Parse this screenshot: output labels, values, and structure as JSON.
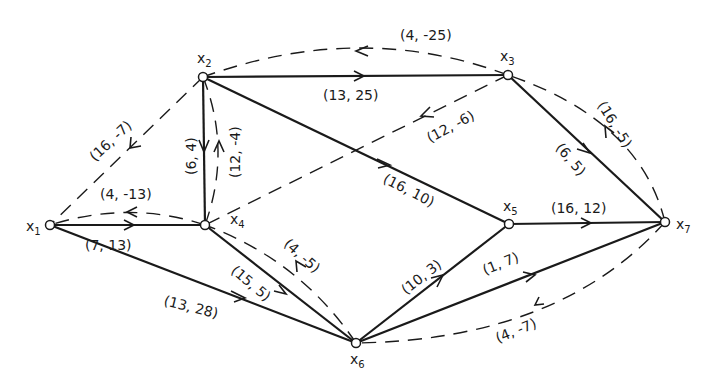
{
  "diagram": {
    "type": "directed network graph (flow network with residual arcs)",
    "nodes": [
      {
        "id": "x1",
        "label": "x",
        "sub": "1",
        "x": 50,
        "y": 225,
        "lx": 26,
        "ly": 231
      },
      {
        "id": "x2",
        "label": "x",
        "sub": "2",
        "x": 203,
        "y": 77,
        "lx": 197,
        "ly": 63
      },
      {
        "id": "x3",
        "label": "x",
        "sub": "3",
        "x": 508,
        "y": 75,
        "lx": 500,
        "ly": 61
      },
      {
        "id": "x4",
        "label": "x",
        "sub": "4",
        "x": 205,
        "y": 225,
        "lx": 230,
        "ly": 224
      },
      {
        "id": "x5",
        "label": "x",
        "sub": "5",
        "x": 509,
        "y": 224,
        "lx": 503,
        "ly": 211
      },
      {
        "id": "x6",
        "label": "x",
        "sub": "6",
        "x": 356,
        "y": 343,
        "lx": 350,
        "ly": 367
      },
      {
        "id": "x7",
        "label": "x",
        "sub": "7",
        "x": 665,
        "y": 222,
        "lx": 676,
        "ly": 229
      }
    ],
    "solid_edges": [
      {
        "from": "x1",
        "to": "x4",
        "label": "(7, 13)",
        "lx": 85,
        "ly": 250,
        "rot": 0
      },
      {
        "from": "x1",
        "to": "x6",
        "label": "(13, 28)",
        "lx": 163,
        "ly": 305,
        "rot": 14
      },
      {
        "from": "x2",
        "to": "x3",
        "label": "(13, 25)",
        "lx": 323,
        "ly": 100,
        "rot": 0
      },
      {
        "from": "x2",
        "to": "x4",
        "label": "(6, 4)",
        "lx": 196,
        "ly": 175,
        "rot": -90
      },
      {
        "from": "x2",
        "to": "x5",
        "label": "(16, 10)",
        "lx": 382,
        "ly": 182,
        "rot": 27
      },
      {
        "from": "x3",
        "to": "x7",
        "label": "(6, 5)",
        "lx": 555,
        "ly": 148,
        "rot": 50
      },
      {
        "from": "x4",
        "to": "x6",
        "label": "(15, 5)",
        "lx": 230,
        "ly": 272,
        "rot": 40
      },
      {
        "from": "x5",
        "to": "x7",
        "label": "(16, 12)",
        "lx": 551,
        "ly": 213,
        "rot": 0
      },
      {
        "from": "x6",
        "to": "x5",
        "label": "(10, 3)",
        "lx": 406,
        "ly": 295,
        "rot": -38
      },
      {
        "from": "x6",
        "to": "x7",
        "label": "(1, 7)",
        "lx": 485,
        "ly": 275,
        "rot": -22
      }
    ],
    "dashed_edges": [
      {
        "from": "x3",
        "to": "x2",
        "label": "(4, -25)",
        "lx": 400,
        "ly": 40,
        "rot": 0
      },
      {
        "from": "x2",
        "to": "x1",
        "label": "(16, -7)",
        "lx": 95,
        "ly": 162,
        "rot": -43
      },
      {
        "from": "x4",
        "to": "x2",
        "label": "(12, -4)",
        "lx": 240,
        "ly": 178,
        "rot": -90
      },
      {
        "from": "x3",
        "to": "x4",
        "label": "(12, -6)",
        "lx": 430,
        "ly": 143,
        "rot": -28
      },
      {
        "from": "x4",
        "to": "x1",
        "label": "(4, -13)",
        "lx": 100,
        "ly": 199,
        "rot": 0
      },
      {
        "from": "x6",
        "to": "x4",
        "label": "(4, -5)",
        "lx": 283,
        "ly": 245,
        "rot": 42
      },
      {
        "from": "x7",
        "to": "x3",
        "label": "(16, -5)",
        "lx": 597,
        "ly": 105,
        "rot": 58
      },
      {
        "from": "x7",
        "to": "x6",
        "label": "(4, -7)",
        "lx": 498,
        "ly": 343,
        "rot": -22
      }
    ]
  }
}
